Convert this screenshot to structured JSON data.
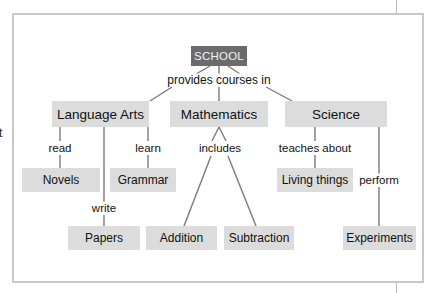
{
  "stray_text": "t",
  "diagram": {
    "type": "concept-map",
    "colors": {
      "root_fill": "#6b6b6b",
      "root_text": "#f2f2f2",
      "node_fill": "#dcdcdc",
      "line": "#7a7a7a",
      "frame": "#c8c8c8"
    },
    "nodes": {
      "school": "SCHOOL",
      "language_arts": "Language Arts",
      "mathematics": "Mathematics",
      "science": "Science",
      "novels": "Novels",
      "grammar": "Grammar",
      "papers": "Papers",
      "addition": "Addition",
      "subtraction": "Subtraction",
      "living_things": "Living things",
      "experiments": "Experiments"
    },
    "links": {
      "provides": "provides courses in",
      "read": "read",
      "learn": "learn",
      "write": "write",
      "includes": "includes",
      "teaches": "teaches about",
      "perform": "perform"
    }
  }
}
